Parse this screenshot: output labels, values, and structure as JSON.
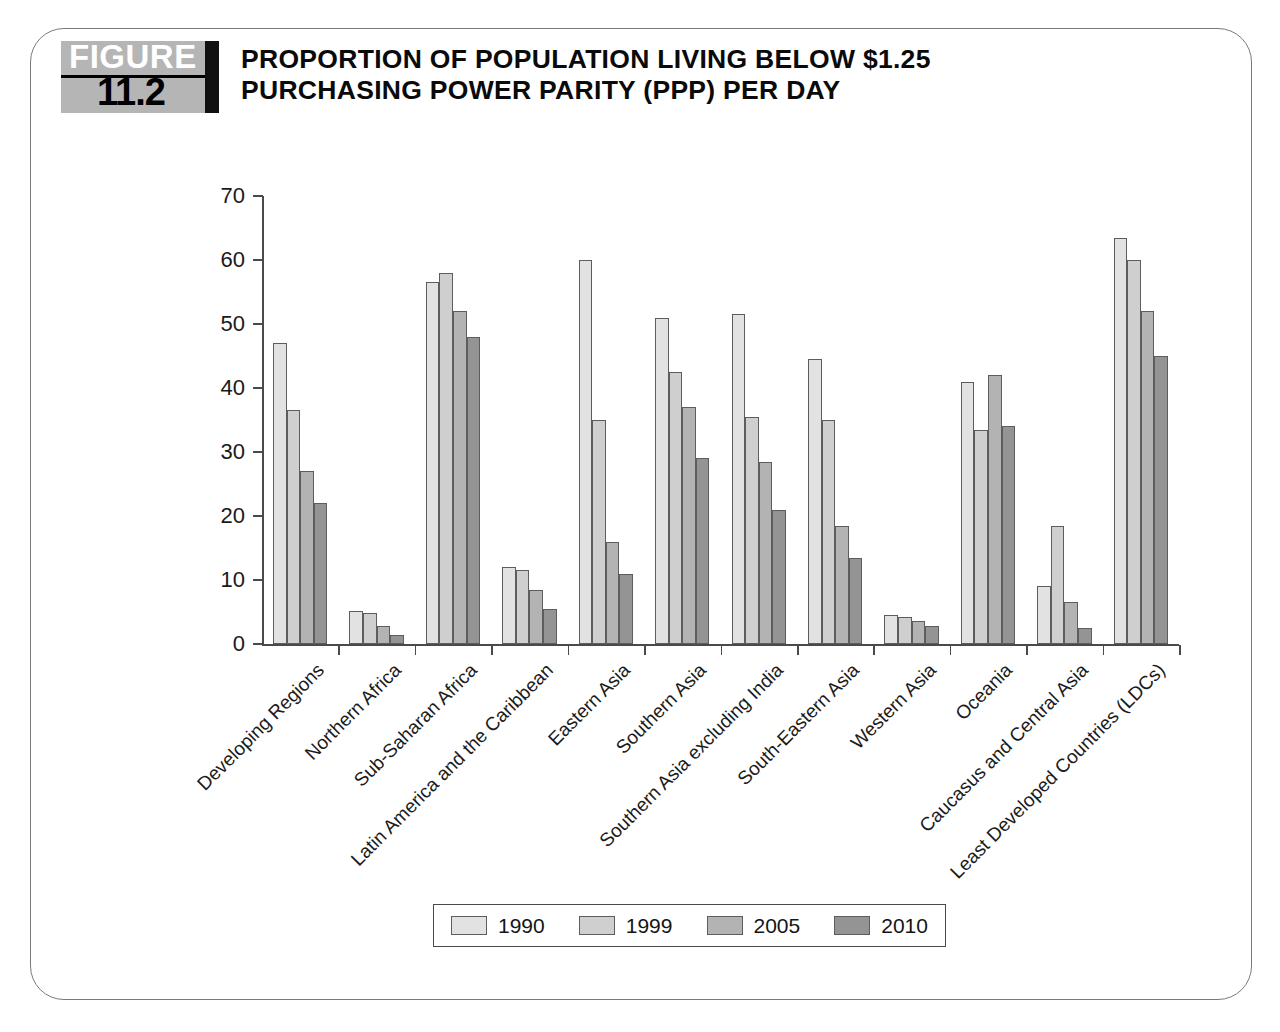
{
  "figure": {
    "badge_word": "FIGURE",
    "badge_number": "11.2",
    "title": "PROPORTION OF POPULATION LIVING BELOW $1.25 PURCHASING POWER PARITY (PPP) PER DAY"
  },
  "chart_data": {
    "type": "bar",
    "title": "PROPORTION OF POPULATION LIVING BELOW $1.25 PURCHASING POWER PARITY (PPP) PER DAY",
    "xlabel": "",
    "ylabel": "",
    "ylim": [
      0,
      70
    ],
    "yticks": [
      0,
      10,
      20,
      30,
      40,
      50,
      60,
      70
    ],
    "ytick_labels": [
      "0",
      "10",
      "20",
      "30",
      "40",
      "50",
      "60",
      "70"
    ],
    "grid": false,
    "legend_position": "bottom",
    "categories": [
      "Developing Regions",
      "Northern  Africa",
      "Sub-Saharan Africa",
      "Latin America and the Caribbean",
      "Eastern Asia",
      "Southern Asia",
      "Southern Asia excluding India",
      "South-Eastern Asia",
      "Western Asia",
      "Oceania",
      "Caucasus and Central Asia",
      "Least Developed Countries (LDCs)"
    ],
    "series": [
      {
        "name": "1990",
        "color": "#e2e2e2",
        "values": [
          47,
          5.1,
          56.5,
          12,
          60,
          51,
          51.5,
          44.5,
          4.5,
          41,
          9,
          63.5
        ]
      },
      {
        "name": "1999",
        "color": "#cfcfcf",
        "values": [
          36.5,
          4.9,
          58,
          11.5,
          35,
          42.5,
          35.5,
          35,
          4.2,
          33.5,
          18.5,
          60
        ]
      },
      {
        "name": "2005",
        "color": "#b3b3b3",
        "values": [
          27,
          2.8,
          52,
          8.5,
          16,
          37,
          28.5,
          18.5,
          3.6,
          42,
          6.5,
          52
        ]
      },
      {
        "name": "2010",
        "color": "#949494",
        "values": [
          22,
          1.4,
          48,
          5.5,
          11,
          29,
          21,
          13.5,
          2.8,
          34,
          2.5,
          45
        ]
      }
    ]
  },
  "legend": {
    "items": [
      {
        "label": "1990"
      },
      {
        "label": "1999"
      },
      {
        "label": "2005"
      },
      {
        "label": "2010"
      }
    ]
  }
}
